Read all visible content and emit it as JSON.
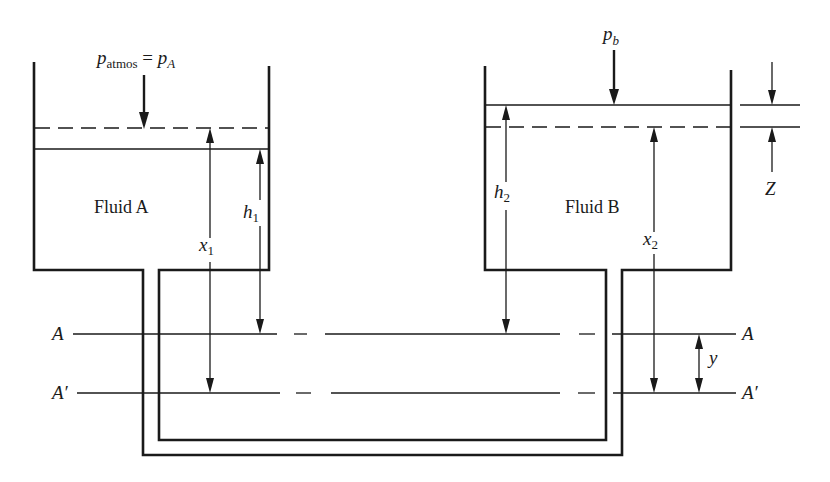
{
  "diagram": {
    "type": "manometer-two-tank",
    "left_tank": {
      "label": "Fluid A",
      "pressure_label_main": "p",
      "pressure_label_sub": "atmos",
      "pressure_equals": " = ",
      "pressure_label2_main": "p",
      "pressure_label2_sub": "A"
    },
    "right_tank": {
      "label": "Fluid B",
      "pressure_label_main": "p",
      "pressure_label_sub": "b"
    },
    "dimensions": {
      "h1_main": "h",
      "h1_sub": "1",
      "x1_main": "x",
      "x1_sub": "1",
      "h2_main": "h",
      "h2_sub": "2",
      "x2_main": "x",
      "x2_sub": "2",
      "z": "Z",
      "y": "y"
    },
    "reference_lines": {
      "a_left": "A",
      "a_right": "A",
      "a_prime_left": "A′",
      "a_prime_right": "A′"
    },
    "colors": {
      "ink": "#1a1a1a",
      "background": "#ffffff"
    }
  }
}
